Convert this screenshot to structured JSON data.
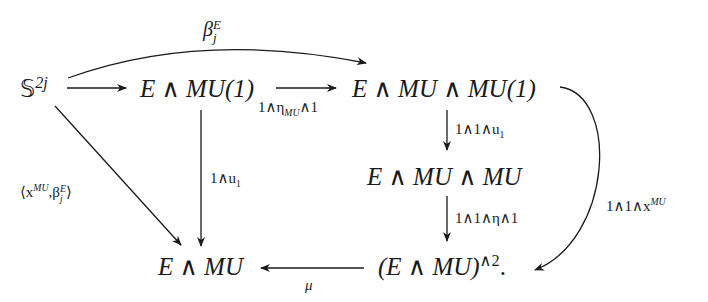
{
  "diagram": {
    "type": "commutative-diagram",
    "nodes": {
      "sphere": {
        "base": "𝕊",
        "sup": "2j"
      },
      "e_mu1": {
        "text": "E ∧ MU(1)"
      },
      "e_mu_mu1": {
        "text": "E ∧ MU ∧ MU(1)"
      },
      "e_mu_mu": {
        "text": "E ∧ MU ∧ MU"
      },
      "e_mu": {
        "text": "E ∧ MU"
      },
      "e_mu_sq": {
        "base": "(E ∧ MU)",
        "sup": "∧2",
        "suffix": "."
      }
    },
    "arrows": {
      "beta_top": {
        "from": "sphere",
        "to": "e_mu_mu1",
        "label_base": "β",
        "label_sub": "j",
        "label_sup": "E"
      },
      "sphere_to_emu1": {
        "from": "sphere",
        "to": "e_mu1",
        "label": ""
      },
      "eta_arrow": {
        "from": "e_mu1",
        "to": "e_mu_mu1",
        "label_pre": "1∧η",
        "label_sub": "MU",
        "label_post": "∧1"
      },
      "diag": {
        "from": "sphere",
        "to": "e_mu",
        "label_pre": "⟨x",
        "label_sup": "MU",
        "label_mid": ",β",
        "label_sub": "j",
        "label_sup2": "E",
        "label_post": "⟩"
      },
      "u1_vert": {
        "from": "e_mu1",
        "to": "e_mu",
        "label_pre": "1∧u",
        "label_sub": "1"
      },
      "u1_right": {
        "from": "e_mu_mu1",
        "to": "e_mu_mu",
        "label_pre": "1∧1∧u",
        "label_sub": "1"
      },
      "eta_right": {
        "from": "e_mu_mu",
        "to": "e_mu_sq",
        "label": "1∧1∧η∧1"
      },
      "mu_arrow": {
        "from": "e_mu_sq",
        "to": "e_mu",
        "label": "μ"
      },
      "x_curve": {
        "from": "e_mu_mu1",
        "to": "e_mu_sq",
        "label_pre": "1∧1∧x",
        "label_sup": "MU"
      }
    }
  }
}
